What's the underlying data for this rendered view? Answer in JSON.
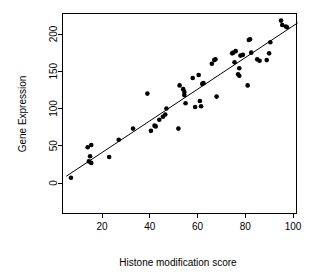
{
  "chart_data": {
    "type": "scatter",
    "title": "",
    "xlabel": "Histone modification score",
    "ylabel": "Gene Expression",
    "xlim": [
      4,
      103
    ],
    "ylim": [
      -4,
      222
    ],
    "xticks": [
      20,
      40,
      60,
      80,
      100
    ],
    "yticks": [
      0,
      50,
      100,
      150,
      200
    ],
    "xtick_labels": [
      "20",
      "40",
      "60",
      "80",
      "100"
    ],
    "ytick_labels": [
      "0",
      "50",
      "100",
      "150",
      "200"
    ],
    "grid": false,
    "legend": null,
    "point_color": "#000000",
    "line_color": "#000000",
    "background_color": "#ffffff",
    "box": true,
    "series": [
      {
        "name": "samples",
        "marker": "filled-circle",
        "points": [
          [
            7,
            7
          ],
          [
            14,
            48
          ],
          [
            14.5,
            29
          ],
          [
            15,
            36
          ],
          [
            15.5,
            51
          ],
          [
            15.5,
            27
          ],
          [
            23,
            35
          ],
          [
            27,
            58
          ],
          [
            33,
            73
          ],
          [
            39,
            120
          ],
          [
            40.5,
            70
          ],
          [
            42,
            77
          ],
          [
            42.5,
            76
          ],
          [
            44,
            85
          ],
          [
            45.5,
            89
          ],
          [
            46.5,
            92
          ],
          [
            47,
            100
          ],
          [
            52,
            73
          ],
          [
            52.5,
            131
          ],
          [
            54,
            126
          ],
          [
            54.5,
            118
          ],
          [
            54.5,
            122
          ],
          [
            55,
            107
          ],
          [
            58,
            141
          ],
          [
            59,
            102
          ],
          [
            60.5,
            145
          ],
          [
            61,
            110
          ],
          [
            61.5,
            103
          ],
          [
            62,
            133
          ],
          [
            62.5,
            134
          ],
          [
            66,
            160
          ],
          [
            67,
            165
          ],
          [
            67.5,
            166
          ],
          [
            68,
            116
          ],
          [
            74.5,
            174
          ],
          [
            75,
            175
          ],
          [
            75.5,
            162
          ],
          [
            76,
            177
          ],
          [
            77,
            146
          ],
          [
            77.5,
            144
          ],
          [
            77.5,
            154
          ],
          [
            78,
            171
          ],
          [
            79,
            172
          ],
          [
            81,
            131
          ],
          [
            81.5,
            192
          ],
          [
            82,
            193
          ],
          [
            82.5,
            175
          ],
          [
            85,
            166
          ],
          [
            86,
            164
          ],
          [
            89,
            165
          ],
          [
            90,
            174
          ],
          [
            90.5,
            189
          ],
          [
            95,
            218
          ],
          [
            95.5,
            212
          ],
          [
            97,
            210
          ],
          [
            97.5,
            209
          ]
        ]
      }
    ],
    "fit_line": {
      "name": "linear fit",
      "x_start": 5,
      "y_start": 9,
      "x_end": 102,
      "y_end": 215
    }
  }
}
